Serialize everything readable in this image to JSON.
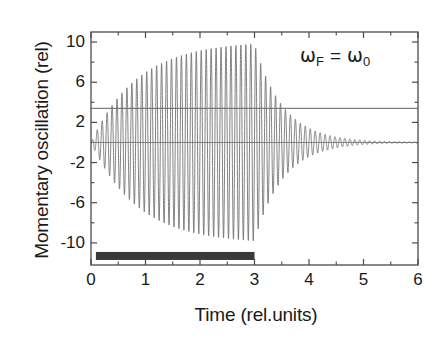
{
  "chart_data": {
    "type": "line",
    "title": "",
    "xlabel": "Time (rel.units)",
    "ylabel": "Momentary oscillation (rel)",
    "xlim": [
      0,
      6
    ],
    "ylim": [
      -12.2,
      11.0
    ],
    "xticks": [
      0,
      1,
      2,
      3,
      4,
      5,
      6
    ],
    "xtick_labels": [
      "0",
      "1",
      "2",
      "3",
      "4",
      "5",
      "6"
    ],
    "yticks": [
      10,
      6,
      2,
      -2,
      -6,
      -10
    ],
    "ytick_labels": [
      "10",
      "6",
      "2",
      "-2",
      "-6",
      "-10"
    ],
    "x_minor_ticks": [
      0.5,
      1.5,
      2.5,
      3.5,
      4.5,
      5.5
    ],
    "y_minor_ticks": [
      8,
      4,
      0,
      -4,
      -8
    ],
    "grid": false,
    "legend": "none",
    "annotations": [
      {
        "name": "resonance-condition",
        "text": "ωF = ω0",
        "omega_symbol": "ω",
        "subscript_driver": "F",
        "equals": "=",
        "subscript_natural": "0",
        "x": 4.35,
        "y": 8.6
      }
    ],
    "series": [
      {
        "name": "momentary-oscillation",
        "type": "oscillation",
        "color": "#6b6b6b",
        "drive_end_time": 3.0,
        "carrier_frequency_cycles": 33.0,
        "buildup_time_constant": 0.85,
        "decay_time_constant": 0.52,
        "peak_amplitude": 9.8,
        "description": "Driven damped oscillator at resonance: amplitude builds up to ~9.8 until t=3, then rings down toward 0 by t~5.5"
      },
      {
        "name": "steady-state-amplitude-line",
        "type": "horizontal-line",
        "color": "#4d4d4d",
        "y": 3.4,
        "x_start": 0.0,
        "x_end": 6.0
      },
      {
        "name": "zero-baseline",
        "type": "horizontal-line",
        "color": "#7a7a7a",
        "y": 0.0,
        "x_start": 0.0,
        "x_end": 6.0
      }
    ],
    "markers": [
      {
        "name": "drive-duration-bar",
        "type": "horizontal-bar",
        "color": "#3a3a3a",
        "y": -11.3,
        "x_start": 0.09,
        "x_end": 3.0,
        "thickness_px": 8
      }
    ]
  },
  "axes": {
    "frame_color": "#4a4a4a",
    "tick_color": "#4a4a4a"
  }
}
